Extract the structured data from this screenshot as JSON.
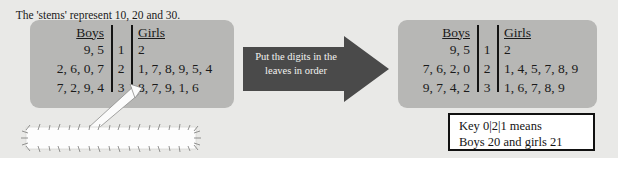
{
  "colors": {
    "page_background": "#e9e9e7",
    "panel_fill": "#b7b7b5",
    "arrow_fill": "#4a4a4a",
    "arrow_text": "#f2f2f0",
    "text": "#1a1a1a",
    "key_box_fill": "#ffffff",
    "key_box_border": "#111111"
  },
  "left_diagram": {
    "headers": {
      "boys": "Boys",
      "girls": "Girls"
    },
    "rows": [
      {
        "boys": "9, 5",
        "stem": "1",
        "girls": "2"
      },
      {
        "boys": "2, 6, 0, 7",
        "stem": "2",
        "girls": "1, 7, 8, 9, 5, 4"
      },
      {
        "boys": "7, 2, 9, 4",
        "stem": "3",
        "girls": "8, 7, 9, 1, 6"
      }
    ]
  },
  "right_diagram": {
    "headers": {
      "boys": "Boys",
      "girls": "Girls"
    },
    "rows": [
      {
        "boys": "9, 5",
        "stem": "1",
        "girls": "2"
      },
      {
        "boys": "7, 6, 2, 0",
        "stem": "2",
        "girls": "1, 4, 5, 7, 8, 9"
      },
      {
        "boys": "9, 7, 4, 2",
        "stem": "3",
        "girls": "1, 6, 7, 8, 9"
      }
    ]
  },
  "arrow": {
    "line1": "Put the digits in the",
    "line2": "leaves in order"
  },
  "callout": {
    "text": "The 'stems' represent 10, 20 and 30."
  },
  "key": {
    "line1": "Key  0|2|1 means",
    "line2": "Boys 20 and girls 21"
  }
}
